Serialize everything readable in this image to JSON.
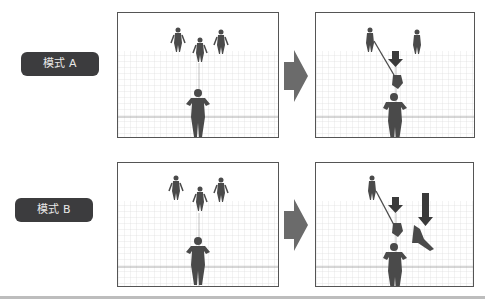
{
  "rows": [
    {
      "label": "模式 A",
      "before": {
        "description": "3 enemies standing far, player in center foreground"
      },
      "after": {
        "description": "player drags nearest enemy toward self; down arrow marks target"
      }
    },
    {
      "label": "模式 B",
      "before": {
        "description": "3 enemies standing far, player in center foreground"
      },
      "after": {
        "description": "player pulls one enemy, another enemy knocked down; two down arrows"
      }
    }
  ],
  "colors": {
    "label_bg": "#3c3c3e",
    "label_text": "#e8e8e8",
    "arrow": "#6b6b6b",
    "frame_border": "#555555",
    "grid": "#d6d6d6",
    "figure": "#4a4a4a"
  }
}
